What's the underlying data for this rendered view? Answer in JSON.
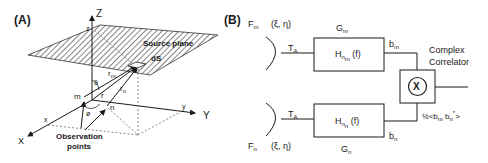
{
  "panel_a": {
    "label": "(A)",
    "axes": {
      "z_upper": "Z",
      "x_upper": "X",
      "y_upper": "Y",
      "x_lower": "x",
      "y_lower": "y",
      "z_lower": "z"
    },
    "source_plane": "Source plane",
    "element": "dS",
    "vectors": {
      "r_m": "r",
      "r_m_sub": "m",
      "r_n": "r",
      "r_n_sub": "n",
      "r": "r"
    },
    "angles": {
      "theta": "θ",
      "phi": "ø"
    },
    "points": {
      "m": "m",
      "n": "n"
    },
    "observation_line1": "Observation",
    "observation_line2": "points"
  },
  "panel_b": {
    "label": "(B)",
    "top": {
      "F": "F",
      "F_sub": "m",
      "coords": "(ξ, η)",
      "T": "T",
      "T_sub": "A",
      "G": "G",
      "G_sub": "m",
      "H": "H",
      "H_sub1": "n",
      "H_sub2": "m",
      "H_arg": "(f)",
      "b": "b",
      "b_sub": "m"
    },
    "bottom": {
      "F": "F",
      "F_sub": "n",
      "coords": "(ξ, η)",
      "T": "T",
      "T_sub": "A",
      "G": "G",
      "G_sub": "n",
      "H": "H",
      "H_sub1": "n",
      "H_sub2": "n",
      "H_arg": "(f)",
      "b": "b",
      "b_sub": "n"
    },
    "correlator_line1": "Complex",
    "correlator_line2": "Correlator",
    "multiplier_symbol": "X",
    "output_prefix": "½<b",
    "output_sub_m": "m",
    "output_mid": " b",
    "output_sub_n": "n",
    "output_sup": "*",
    "output_suffix": ">"
  }
}
